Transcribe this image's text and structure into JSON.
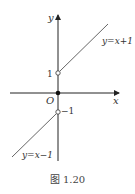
{
  "figure": {
    "caption": "图 1.20",
    "axes": {
      "x_label": "x",
      "y_label": "y",
      "origin_label": "O"
    },
    "ticks": {
      "y_pos": "1",
      "y_neg": "−1"
    },
    "lines": [
      {
        "label": "y=x+1",
        "domain": "x>0",
        "start_point": [
          0,
          1
        ],
        "start_open": true
      },
      {
        "label": "y=x−1",
        "domain": "x<0",
        "start_point": [
          0,
          -1
        ],
        "start_open": true
      }
    ],
    "points": [
      {
        "at": [
          0,
          0
        ],
        "style": "filled"
      },
      {
        "at": [
          0,
          1
        ],
        "style": "open"
      },
      {
        "at": [
          0,
          -1
        ],
        "style": "open"
      }
    ],
    "colors": {
      "stroke": "#333333"
    }
  }
}
